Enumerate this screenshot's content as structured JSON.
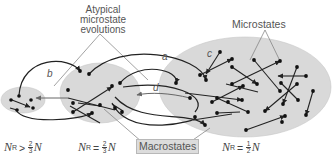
{
  "figure": {
    "labels": {
      "atypical": [
        "Atypical",
        "microstate",
        "evolutions"
      ],
      "microstates": "Microstates",
      "macrostates": "Macrostates"
    },
    "path_letters": {
      "a": "a",
      "b": "b",
      "c": "c",
      "d": "d"
    },
    "equations": [
      {
        "var": "N",
        "sub": "R",
        "op": ">",
        "num": "2",
        "den": "3",
        "tail": "N"
      },
      {
        "var": "N",
        "sub": "R",
        "op": "=",
        "num": "2",
        "den": "3",
        "tail": "N"
      },
      {
        "var": "N",
        "sub": "R",
        "op": "=",
        "num": "1",
        "den": "2",
        "tail": "N"
      }
    ],
    "colors": {
      "ellipse_fill": "#d9d9d9",
      "ellipse_stroke": "#c4c4c4",
      "dot": "#111111",
      "arrow": "#222222",
      "pointer_line": "#7a7a7a",
      "text": "#555555"
    }
  }
}
